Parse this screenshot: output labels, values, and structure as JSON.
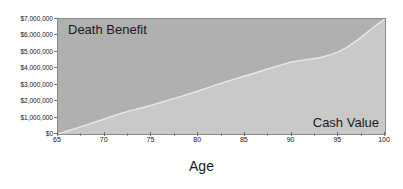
{
  "chart_data": {
    "type": "area",
    "title": "",
    "subtitle": "",
    "xlabel": "Age",
    "ylabel": "",
    "xlim": [
      65,
      100
    ],
    "ylim": [
      0,
      7000000
    ],
    "grid": false,
    "legend_position": "in-plot-annotations",
    "x_tick_labels": [
      "65",
      "70",
      "75",
      "80",
      "85",
      "90",
      "95",
      "100"
    ],
    "x_ticks": [
      65,
      70,
      75,
      80,
      85,
      90,
      95,
      100
    ],
    "x_minor_ticks": [
      67.5,
      72.5,
      77.5,
      82.5,
      87.5,
      92.5,
      97.5
    ],
    "y_ticks": [
      0,
      1000000,
      2000000,
      3000000,
      4000000,
      5000000,
      6000000,
      7000000
    ],
    "y_tick_labels": [
      "$0",
      "$1,000,000",
      "$2,000,000",
      "$3,000,000",
      "$4,000,000",
      "$5,000,000",
      "$6,000,000",
      "$7,000,000"
    ],
    "annotations": [
      {
        "text": "Death Benefit",
        "region": "upper-left"
      },
      {
        "text": "Cash Value",
        "region": "lower-right"
      }
    ],
    "x": [
      65,
      66,
      67,
      68,
      69,
      70,
      71,
      72,
      73,
      74,
      75,
      76,
      77,
      78,
      79,
      80,
      81,
      82,
      83,
      84,
      85,
      86,
      87,
      88,
      89,
      90,
      91,
      92,
      93,
      94,
      95,
      96,
      97,
      98,
      99,
      100
    ],
    "series": [
      {
        "name": "Cash Value",
        "color": "#c9c9c9",
        "values": [
          0,
          180000,
          360000,
          545000,
          730000,
          920000,
          1110000,
          1300000,
          1450000,
          1600000,
          1760000,
          1920000,
          2090000,
          2260000,
          2440000,
          2620000,
          2810000,
          3000000,
          3180000,
          3360000,
          3530000,
          3700000,
          3880000,
          4050000,
          4220000,
          4380000,
          4480000,
          4560000,
          4640000,
          4800000,
          5000000,
          5300000,
          5700000,
          6150000,
          6600000,
          7000000
        ]
      },
      {
        "name": "Death Benefit",
        "color": "#b0b0b0",
        "values": [
          7000000,
          7000000,
          7000000,
          7000000,
          7000000,
          7000000,
          7000000,
          7000000,
          7000000,
          7000000,
          7000000,
          7000000,
          7000000,
          7000000,
          7000000,
          7000000,
          7000000,
          7000000,
          7000000,
          7000000,
          7000000,
          7000000,
          7000000,
          7000000,
          7000000,
          7000000,
          7000000,
          7000000,
          7000000,
          7000000,
          7000000,
          7000000,
          7000000,
          7000000,
          7000000,
          7000000
        ]
      }
    ],
    "colors": {
      "death_benefit_fill": "#b0b0b0",
      "cash_value_fill": "#c9c9c9",
      "boundary_highlight": "#e8e8e8",
      "axis_line": "#8a8a8a",
      "text": "#121212",
      "background": "#ffffff"
    }
  },
  "axis": {
    "x_title": "Age"
  }
}
